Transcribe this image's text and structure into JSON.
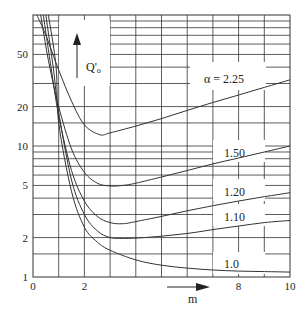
{
  "chart_data": {
    "type": "line",
    "title": "",
    "xlabel": "m",
    "ylabel": "Q'o",
    "xscale": "linear",
    "yscale": "log",
    "xlim": [
      0,
      10
    ],
    "ylim": [
      1,
      100
    ],
    "x_ticks": [
      0,
      2,
      4,
      6,
      8,
      10
    ],
    "x_tick_labels": [
      "0",
      "2",
      "",
      "",
      "8",
      "10"
    ],
    "y_ticks": [
      1,
      2,
      5,
      10,
      20,
      50
    ],
    "y_tick_labels": [
      "1",
      "2",
      "5",
      "10",
      "20",
      "50"
    ],
    "grid": true,
    "series": [
      {
        "name": "α = 2.25",
        "label": "α = 2.25",
        "x": [
          0.15,
          0.5,
          1.0,
          1.5,
          2.0,
          2.6,
          3.0,
          4.0,
          5.0,
          6.0,
          7.0,
          8.0,
          9.0,
          10.0
        ],
        "values": [
          100,
          70,
          38,
          22,
          14.5,
          12.2,
          12.6,
          14.2,
          16.2,
          18.7,
          21.5,
          24.5,
          28.0,
          32.0
        ]
      },
      {
        "name": "1.50",
        "label": "1.50",
        "x": [
          0.3,
          0.6,
          1.0,
          1.5,
          2.0,
          2.5,
          3.0,
          3.5,
          4.0,
          5.0,
          6.0,
          7.0,
          8.0,
          9.0,
          10.0
        ],
        "values": [
          100,
          45,
          20,
          9.5,
          6.3,
          5.2,
          4.95,
          5.0,
          5.2,
          5.8,
          6.5,
          7.3,
          8.1,
          9.0,
          10.0
        ]
      },
      {
        "name": "1.20",
        "label": "1.20",
        "x": [
          0.4,
          0.7,
          1.0,
          1.5,
          2.0,
          2.5,
          3.0,
          3.5,
          4.0,
          5.0,
          6.0,
          7.0,
          8.0,
          9.0,
          10.0
        ],
        "values": [
          100,
          40,
          17,
          6.5,
          3.8,
          2.9,
          2.6,
          2.55,
          2.65,
          2.9,
          3.2,
          3.5,
          3.8,
          4.1,
          4.4
        ]
      },
      {
        "name": "1.10",
        "label": "1.10",
        "x": [
          0.5,
          0.8,
          1.0,
          1.5,
          2.0,
          2.5,
          3.0,
          3.5,
          4.0,
          5.0,
          6.0,
          7.0,
          8.0,
          9.0,
          10.0
        ],
        "values": [
          100,
          38,
          18,
          5.5,
          3.0,
          2.25,
          2.0,
          1.97,
          1.98,
          2.05,
          2.15,
          2.3,
          2.45,
          2.6,
          2.7
        ]
      },
      {
        "name": "1.0",
        "label": "1.0",
        "x": [
          0.6,
          0.9,
          1.0,
          1.5,
          2.0,
          2.5,
          3.0,
          4.0,
          5.0,
          6.0,
          7.0,
          8.0,
          9.0,
          10.0
        ],
        "values": [
          100,
          40,
          15,
          4.5,
          2.4,
          1.85,
          1.6,
          1.35,
          1.23,
          1.17,
          1.13,
          1.11,
          1.1,
          1.09
        ]
      }
    ],
    "annotations": [
      {
        "text": "Q'o",
        "type": "y-axis arrow label"
      },
      {
        "text": "m",
        "type": "x-axis arrow label"
      }
    ]
  },
  "labels": {
    "ylabel_main": "Q'",
    "ylabel_sub": "o",
    "xlabel": "m",
    "curve_2_25": "α = 2.25",
    "curve_1_50": "1.50",
    "curve_1_20": "1.20",
    "curve_1_10": "1.10",
    "curve_1_0": "1.0"
  }
}
